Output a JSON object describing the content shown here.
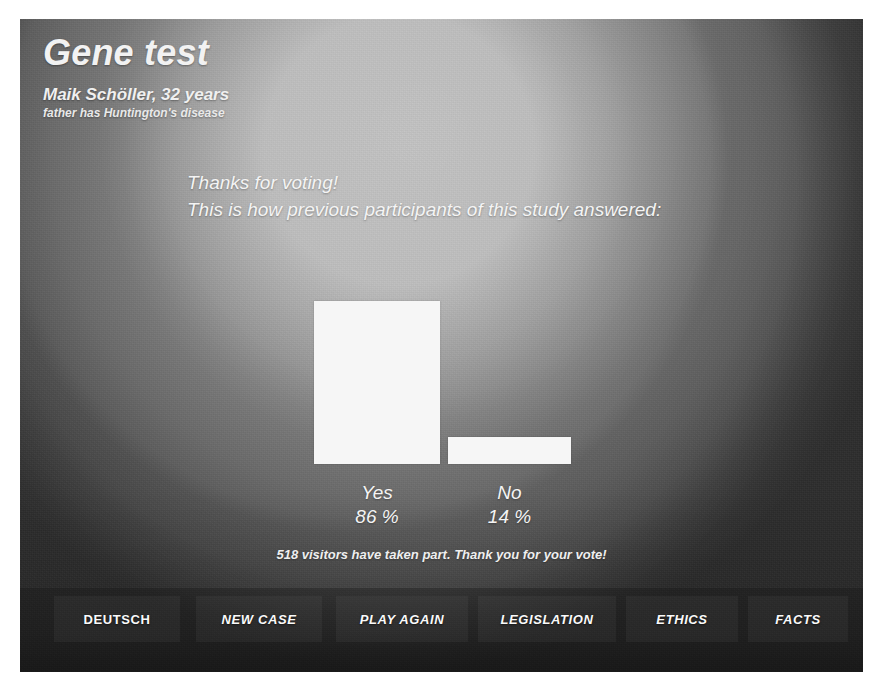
{
  "header": {
    "title": "Gene test",
    "patient_name": "Maik Schöller, 32 years",
    "patient_note": "father has Huntington's disease"
  },
  "message": {
    "line1": "Thanks for voting!",
    "line2": "This is how previous participants of this study answered:"
  },
  "results": {
    "visitor_note": "518 visitors have taken part. Thank you for your vote!"
  },
  "chart_data": {
    "type": "bar",
    "title": "This is how previous participants of this study answered:",
    "categories": [
      "Yes",
      "No"
    ],
    "values": [
      86,
      14
    ],
    "value_labels": [
      "86 %",
      "14 %"
    ],
    "xlabel": "",
    "ylabel": "",
    "ylim": [
      0,
      100
    ],
    "grid": false,
    "legend": "none",
    "bar_color": "#f6f6f6",
    "total_votes": 518
  },
  "nav": {
    "buttons": [
      {
        "label": "DEUTSCH",
        "style": "upright"
      },
      {
        "label": "NEW CASE",
        "style": "italic"
      },
      {
        "label": "PLAY AGAIN",
        "style": "italic"
      },
      {
        "label": "LEGISLATION",
        "style": "italic"
      },
      {
        "label": "ETHICS",
        "style": "italic"
      },
      {
        "label": "FACTS",
        "style": "italic"
      }
    ]
  },
  "colors": {
    "bar": "#f6f6f6",
    "text": "#f4f4f4",
    "background_center": "#bdbdbd",
    "background_edge": "#343434"
  }
}
